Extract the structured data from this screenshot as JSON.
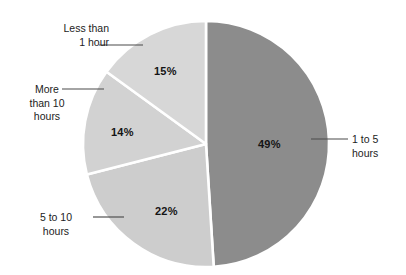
{
  "chart_data": {
    "type": "pie",
    "title": "",
    "subtitle": "",
    "xlabel": "",
    "ylabel": "",
    "legend": "none",
    "grid": false,
    "start_angle_deg": 0,
    "direction": "clockwise",
    "center": {
      "x": 206,
      "y": 144
    },
    "radius": 123,
    "categories": [
      "1 to 5 hours",
      "5 to 10 hours",
      "More than 10 hours",
      "Less than 1 hour"
    ],
    "values": [
      49,
      22,
      14,
      15
    ],
    "value_labels": [
      "49%",
      "22%",
      "14%",
      "15%"
    ],
    "units": "percent",
    "total": 100,
    "slices": [
      {
        "label": "1 to 5 hours",
        "label_lines": [
          "1 to 5",
          "hours"
        ],
        "value": 49,
        "value_label": "49%",
        "color": "#8c8c8c",
        "start_deg": 0,
        "end_deg": 176.4
      },
      {
        "label": "5 to 10 hours",
        "label_lines": [
          "5 to 10",
          "hours"
        ],
        "value": 22,
        "value_label": "22%",
        "color": "#cdcdcd",
        "start_deg": 176.4,
        "end_deg": 255.6
      },
      {
        "label": "More than 10 hours",
        "label_lines": [
          "More",
          "than 10",
          "hours"
        ],
        "value": 14,
        "value_label": "14%",
        "color": "#d2d2d2",
        "start_deg": 255.6,
        "end_deg": 306.0
      },
      {
        "label": "Less than 1 hour",
        "label_lines": [
          "Less than",
          "1 hour"
        ],
        "value": 15,
        "value_label": "15%",
        "color": "#d7d7d7",
        "start_deg": 306.0,
        "end_deg": 360.0
      }
    ],
    "colors": {
      "background": "#ffffff",
      "separator": "#ffffff",
      "leader_line": "#4a4a4a",
      "label_text": "#1c1c1c",
      "value_text": "#141414"
    }
  }
}
